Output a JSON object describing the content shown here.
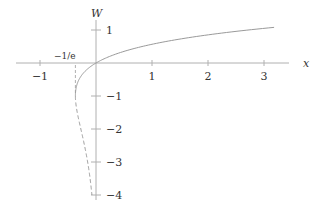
{
  "chart_data": {
    "type": "line",
    "title": "",
    "xlabel": "x",
    "ylabel": "W",
    "xlim": [
      -1.4,
      3.4
    ],
    "ylim": [
      -4.1,
      1.5
    ],
    "grid": false,
    "legend": null,
    "x_ticks": [
      -1,
      1,
      2,
      3
    ],
    "x_tick_labels": [
      "−1",
      "1",
      "2",
      "3"
    ],
    "y_ticks": [
      1,
      -1,
      -2,
      -3,
      -4
    ],
    "y_tick_labels": [
      "1",
      "−1",
      "−2",
      "−3",
      "−4"
    ],
    "annotations": [
      {
        "text": "−1/e",
        "x": -0.3679,
        "y": 0,
        "note": "branch point abscissa, marked with dashed vertical line"
      }
    ],
    "series": [
      {
        "name": "W0 (principal branch)",
        "style": "solid",
        "w_range": [
          -1,
          1.08
        ],
        "points": [
          [
            -0.3679,
            -1
          ],
          [
            -0.3012,
            -0.5
          ],
          [
            -0.1637,
            -0.2
          ],
          [
            0,
            0
          ],
          [
            0.3133,
            0.25
          ],
          [
            0.8244,
            0.5
          ],
          [
            1.5878,
            0.75
          ],
          [
            2.7183,
            1
          ],
          [
            3.2,
            1.06
          ]
        ]
      },
      {
        "name": "W-1 (lower branch)",
        "style": "dashed",
        "w_range": [
          -4,
          -1
        ],
        "points": [
          [
            -0.3679,
            -1
          ],
          [
            -0.3347,
            -1.5
          ],
          [
            -0.2707,
            -2
          ],
          [
            -0.2052,
            -2.5
          ],
          [
            -0.1494,
            -3
          ],
          [
            -0.1057,
            -3.5
          ],
          [
            -0.0733,
            -4
          ]
        ]
      }
    ]
  },
  "colors": {
    "axis": "#b0b0b0",
    "curve": "#9a9a9a",
    "text": "#333333",
    "background": "#ffffff"
  }
}
